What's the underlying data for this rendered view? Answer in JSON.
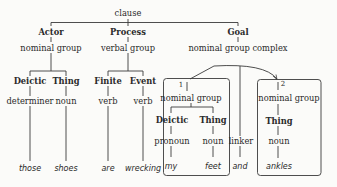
{
  "root": {
    "label": "clause"
  },
  "functions": {
    "actor": "Actor",
    "process": "Process",
    "goal": "Goal"
  },
  "groups": {
    "actor": "nominal group",
    "process": "verbal group",
    "goal": "nominal group complex"
  },
  "actor_children": {
    "functions": [
      "Deictic",
      "Thing"
    ],
    "classes": [
      "determiner",
      "noun"
    ],
    "words": [
      "those",
      "shoes"
    ]
  },
  "process_children": {
    "functions": [
      "Finite",
      "Event"
    ],
    "classes": [
      "verb",
      "verb"
    ],
    "words": [
      "are",
      "wrecking"
    ]
  },
  "complex": {
    "unit1": {
      "index": "1",
      "group": "nominal group",
      "functions": [
        "Deictic",
        "Thing"
      ],
      "classes": [
        "pronoun",
        "noun"
      ],
      "words": [
        "my",
        "feet"
      ]
    },
    "linker": {
      "class": "linker",
      "word": "and"
    },
    "unit2": {
      "index": "2",
      "group": "nominal group",
      "functions": [
        "Thing"
      ],
      "classes": [
        "noun"
      ],
      "words": [
        "ankles"
      ]
    }
  },
  "colors": {
    "line": "#3a3a3a",
    "text": "#2a2a2a",
    "background": "#fbfbf9"
  }
}
